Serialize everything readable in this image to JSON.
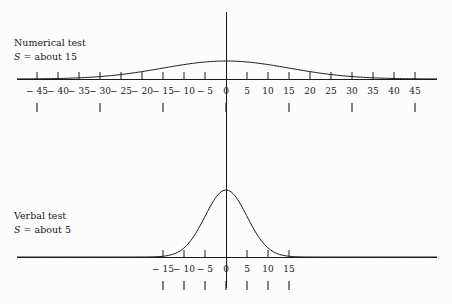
{
  "figure": {
    "background_color": "#fcfcfc",
    "line_color": "#1a1a1a",
    "width": 452,
    "height": 304
  },
  "panels": [
    {
      "id": "numerical",
      "caption_title": "Numerical test",
      "caption_symbol": "S",
      "caption_equals": " = about 15",
      "caption_full": "S = about 15",
      "axis": {
        "baseline_y": 79,
        "x_left": 17,
        "x_right": 437,
        "zero_x": 226,
        "px_per_unit": 4.2
      },
      "tick_labels": [
        "− 45",
        "− 40",
        "− 35",
        "− 30",
        "− 25",
        "− 20",
        "− 15",
        "− 10",
        "− 5",
        "0",
        "5",
        "10",
        "15",
        "20",
        "25",
        "30",
        "35",
        "40",
        "45"
      ],
      "tick_values": [
        -45,
        -40,
        -35,
        -30,
        -25,
        -20,
        -15,
        -10,
        -5,
        0,
        5,
        10,
        15,
        20,
        25,
        30,
        35,
        40,
        45
      ],
      "sd_tick_values": [
        -45,
        -30,
        -15,
        0,
        15,
        30,
        45
      ],
      "curve": {
        "sd_units": 15,
        "peak_y": 61,
        "peak_height": 18
      }
    },
    {
      "id": "verbal",
      "caption_title": "Verbal test",
      "caption_symbol": "S",
      "caption_equals": " = about 5",
      "caption_full": "S = about 5",
      "axis": {
        "baseline_y": 257,
        "x_left": 17,
        "x_right": 437,
        "zero_x": 226,
        "px_per_unit": 4.2
      },
      "tick_labels": [
        "− 15",
        "− 10",
        "− 5",
        "0",
        "5",
        "10",
        "15"
      ],
      "tick_values": [
        -15,
        -10,
        -5,
        0,
        5,
        10,
        15
      ],
      "sd_tick_values": [
        -15,
        -10,
        -5,
        0,
        5,
        10,
        15
      ],
      "curve": {
        "sd_units": 5,
        "peak_y": 190,
        "peak_height": 67
      }
    }
  ],
  "center_line": {
    "x": 226,
    "y_top": 12,
    "y_bottom": 288
  },
  "chart_data": {
    "type": "line",
    "title": "",
    "xlabel": "",
    "ylabel": "",
    "grid": false,
    "legend": "none",
    "series": [
      {
        "name": "Numerical test",
        "annotation": "S = about 15",
        "distribution": "normal",
        "mean": 0,
        "sd": 15,
        "x_range": [
          -45,
          45
        ],
        "x_ticks": [
          -45,
          -40,
          -35,
          -30,
          -25,
          -20,
          -15,
          -10,
          -5,
          0,
          5,
          10,
          15,
          20,
          25,
          30,
          35,
          40,
          45
        ],
        "sd_ticks": [
          -45,
          -30,
          -15,
          0,
          15,
          30,
          45
        ],
        "x": [
          -45,
          -40,
          -35,
          -30,
          -25,
          -20,
          -15,
          -10,
          -5,
          0,
          5,
          10,
          15,
          20,
          25,
          30,
          35,
          40,
          45
        ],
        "values": [
          0.01,
          0.04,
          0.09,
          0.14,
          0.25,
          0.41,
          0.61,
          0.8,
          0.95,
          1.0,
          0.95,
          0.8,
          0.61,
          0.41,
          0.25,
          0.14,
          0.09,
          0.04,
          0.01
        ]
      },
      {
        "name": "Verbal test",
        "annotation": "S = about 5",
        "distribution": "normal",
        "mean": 0,
        "sd": 5,
        "x_range": [
          -15,
          15
        ],
        "x_ticks": [
          -15,
          -10,
          -5,
          0,
          5,
          10,
          15
        ],
        "sd_ticks": [
          -15,
          -10,
          -5,
          0,
          5,
          10,
          15
        ],
        "x": [
          -15,
          -12.5,
          -10,
          -7.5,
          -5,
          -2.5,
          0,
          2.5,
          5,
          7.5,
          10,
          12.5,
          15
        ],
        "values": [
          0.01,
          0.04,
          0.14,
          0.32,
          0.61,
          0.88,
          1.0,
          0.88,
          0.61,
          0.32,
          0.14,
          0.04,
          0.01
        ]
      }
    ]
  }
}
